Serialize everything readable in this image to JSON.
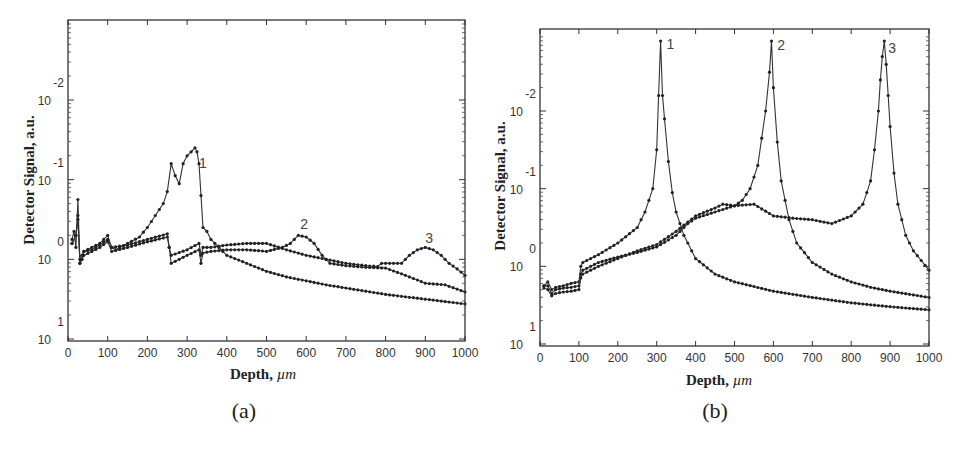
{
  "figure": {
    "panels": [
      "(a)",
      "(b)"
    ]
  },
  "chart_data": [
    {
      "id": "a",
      "panel_label": "(a)",
      "type": "line",
      "title": "",
      "xlabel": "Depth,",
      "xlabel_unit": "µm",
      "ylabel": "Detector Signal, a.u.",
      "xlim": [
        0,
        1000
      ],
      "xticks": [
        0,
        100,
        200,
        300,
        400,
        500,
        600,
        700,
        800,
        900,
        1000
      ],
      "yscale": "log",
      "yticks": [
        {
          "base": "10",
          "exp": "-2",
          "pos": -2
        },
        {
          "base": "10",
          "exp": "-1",
          "pos": -1
        },
        {
          "base": "10",
          "exp": "0",
          "pos": 0
        },
        {
          "base": "10",
          "exp": "1",
          "pos": 1
        }
      ],
      "ylim_pos": [
        -3.0,
        1.03
      ],
      "grid": false,
      "legend": "curve number labels placed near peaks",
      "series": [
        {
          "name": "1",
          "label_at": [
            330,
            -1.15
          ],
          "x": [
            10,
            15,
            20,
            25,
            30,
            35,
            40,
            60,
            80,
            100,
            110,
            120,
            150,
            180,
            200,
            220,
            240,
            250,
            260,
            270,
            280,
            290,
            300,
            310,
            320,
            325,
            330,
            335,
            340,
            350,
            360,
            380,
            400,
            450,
            500,
            550,
            600,
            650,
            700,
            750,
            800,
            850,
            900,
            950,
            1000
          ],
          "y_pos": [
            -0.25,
            -0.35,
            -0.15,
            -0.75,
            0.05,
            0.0,
            -0.1,
            -0.15,
            -0.2,
            -0.3,
            -0.15,
            -0.12,
            -0.2,
            -0.28,
            -0.4,
            -0.55,
            -0.7,
            -0.85,
            -1.2,
            -1.05,
            -0.95,
            -1.2,
            -1.3,
            -1.35,
            -1.4,
            -1.35,
            -1.2,
            -0.8,
            -0.4,
            -0.35,
            -0.25,
            -0.15,
            -0.05,
            0.05,
            0.15,
            0.22,
            0.27,
            0.32,
            0.36,
            0.4,
            0.44,
            0.47,
            0.5,
            0.53,
            0.56
          ]
        },
        {
          "name": "2",
          "label_at": [
            585,
            -0.38
          ],
          "x": [
            10,
            20,
            25,
            30,
            35,
            40,
            60,
            80,
            100,
            110,
            150,
            200,
            250,
            255,
            260,
            300,
            330,
            335,
            340,
            360,
            400,
            450,
            500,
            540,
            560,
            580,
            600,
            620,
            640,
            660,
            700,
            750,
            800,
            850,
            900,
            950,
            1000
          ],
          "y_pos": [
            -0.2,
            -0.3,
            -0.55,
            0.05,
            0.0,
            -0.05,
            -0.1,
            -0.15,
            -0.22,
            -0.1,
            -0.15,
            -0.22,
            -0.28,
            -0.15,
            0.05,
            -0.05,
            -0.12,
            0.05,
            -0.08,
            -0.1,
            -0.12,
            -0.12,
            -0.1,
            -0.15,
            -0.2,
            -0.3,
            -0.28,
            -0.2,
            -0.05,
            0.05,
            0.08,
            0.1,
            0.11,
            0.2,
            0.3,
            0.32,
            0.41
          ]
        },
        {
          "name": "3",
          "label_at": [
            900,
            -0.2
          ],
          "x": [
            10,
            20,
            25,
            30,
            35,
            40,
            60,
            80,
            100,
            110,
            150,
            200,
            250,
            255,
            260,
            300,
            330,
            335,
            340,
            360,
            400,
            450,
            500,
            550,
            600,
            650,
            700,
            750,
            780,
            790,
            800,
            840,
            860,
            880,
            900,
            920,
            940,
            960,
            980,
            1000
          ],
          "y_pos": [
            -0.2,
            -0.3,
            -0.5,
            0.0,
            -0.05,
            -0.1,
            -0.12,
            -0.18,
            -0.25,
            -0.15,
            -0.18,
            -0.25,
            -0.32,
            -0.15,
            -0.05,
            -0.12,
            -0.2,
            -0.05,
            -0.15,
            -0.15,
            -0.18,
            -0.2,
            -0.2,
            -0.12,
            -0.05,
            0.0,
            0.05,
            0.08,
            0.09,
            0.05,
            0.05,
            0.05,
            -0.05,
            -0.12,
            -0.15,
            -0.12,
            -0.05,
            0.05,
            0.12,
            0.2
          ]
        }
      ]
    },
    {
      "id": "b",
      "panel_label": "(b)",
      "type": "line",
      "title": "",
      "xlabel": "Depth,",
      "xlabel_unit": "µm",
      "ylabel": "Detector Signal, a.u.",
      "xlim": [
        0,
        1000
      ],
      "xticks": [
        0,
        100,
        200,
        300,
        400,
        500,
        600,
        700,
        800,
        900,
        1000
      ],
      "yscale": "log",
      "yticks": [
        {
          "base": "10",
          "exp": "-2",
          "pos": -2
        },
        {
          "base": "10",
          "exp": "-1",
          "pos": -1
        },
        {
          "base": "10",
          "exp": "0",
          "pos": 0
        },
        {
          "base": "10",
          "exp": "1",
          "pos": 1
        }
      ],
      "ylim_pos": [
        -3.1,
        1.03
      ],
      "grid": false,
      "legend": "curve number labels placed near peaks",
      "series": [
        {
          "name": "1",
          "label_at": [
            325,
            -2.8
          ],
          "x": [
            10,
            20,
            30,
            40,
            60,
            80,
            100,
            105,
            110,
            150,
            200,
            250,
            270,
            290,
            300,
            305,
            310,
            315,
            320,
            330,
            340,
            350,
            370,
            400,
            450,
            500,
            600,
            700,
            800,
            900,
            1000
          ],
          "y_pos": [
            0.25,
            0.2,
            0.3,
            0.27,
            0.25,
            0.22,
            0.2,
            0.0,
            -0.05,
            -0.15,
            -0.3,
            -0.5,
            -0.7,
            -1.0,
            -1.5,
            -2.2,
            -2.9,
            -2.2,
            -1.9,
            -1.35,
            -0.95,
            -0.7,
            -0.4,
            -0.1,
            0.1,
            0.2,
            0.32,
            0.4,
            0.47,
            0.52,
            0.56
          ]
        },
        {
          "name": "2",
          "label_at": [
            610,
            -2.78
          ],
          "x": [
            10,
            20,
            30,
            40,
            60,
            80,
            100,
            105,
            110,
            150,
            200,
            250,
            300,
            350,
            380,
            400,
            450,
            500,
            520,
            540,
            560,
            580,
            590,
            595,
            600,
            610,
            620,
            640,
            660,
            700,
            750,
            800,
            850,
            900,
            950,
            1000
          ],
          "y_pos": [
            0.25,
            0.25,
            0.35,
            0.3,
            0.28,
            0.27,
            0.25,
            0.1,
            0.05,
            -0.05,
            -0.12,
            -0.18,
            -0.25,
            -0.4,
            -0.55,
            -0.62,
            -0.7,
            -0.78,
            -0.85,
            -1.0,
            -1.3,
            -2.0,
            -2.5,
            -2.9,
            -2.3,
            -1.6,
            -1.1,
            -0.6,
            -0.3,
            -0.05,
            0.1,
            0.2,
            0.27,
            0.32,
            0.36,
            0.4
          ]
        },
        {
          "name": "3",
          "label_at": [
            895,
            -2.75
          ],
          "x": [
            10,
            20,
            30,
            40,
            60,
            80,
            100,
            105,
            110,
            150,
            200,
            250,
            300,
            350,
            400,
            450,
            470,
            500,
            550,
            600,
            650,
            700,
            750,
            800,
            830,
            850,
            860,
            870,
            875,
            880,
            885,
            890,
            895,
            900,
            910,
            920,
            940,
            960,
            1000
          ],
          "y_pos": [
            0.28,
            0.3,
            0.38,
            0.35,
            0.33,
            0.32,
            0.3,
            0.15,
            0.1,
            0.0,
            -0.1,
            -0.2,
            -0.28,
            -0.45,
            -0.65,
            -0.75,
            -0.8,
            -0.78,
            -0.8,
            -0.65,
            -0.62,
            -0.6,
            -0.55,
            -0.65,
            -0.8,
            -1.1,
            -1.5,
            -2.0,
            -2.4,
            -2.7,
            -2.9,
            -2.6,
            -2.2,
            -1.8,
            -1.2,
            -0.8,
            -0.4,
            -0.2,
            0.05
          ]
        }
      ]
    }
  ]
}
